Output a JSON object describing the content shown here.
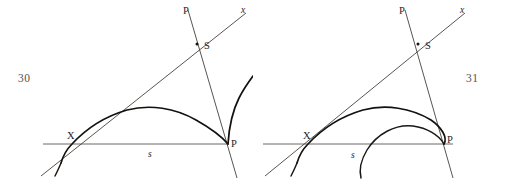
{
  "document": {
    "kind": "geometry-figure-pair",
    "background_color": "#ffffff",
    "ink_color": "#13100e",
    "thin_line_color": "#3a3632",
    "baseline_color": "#6b6864"
  },
  "figures": [
    {
      "id": "figure-30",
      "page_number": "30",
      "page_number_side": "left",
      "caption": "",
      "labels": {
        "apex_line": "P",
        "ray": "x",
        "intersection": "S",
        "left_point": "X",
        "right_point": "P",
        "baseline": "s"
      },
      "description": "Cycloid-type curve with a cusp at P and an ascending branch",
      "geometry": {
        "baseline_y": 144,
        "point_X": [
          64,
          144
        ],
        "point_P": [
          228,
          144
        ],
        "point_S": [
          197,
          44
        ],
        "ray_x_end": [
          245,
          14
        ],
        "line_P_top": [
          188,
          10
        ],
        "line_P_bottom": [
          236,
          178
        ]
      }
    },
    {
      "id": "figure-31",
      "page_number": "31",
      "page_number_side": "right",
      "caption": "",
      "labels": {
        "apex_line": "P",
        "ray": "x",
        "intersection": "S",
        "left_point": "X",
        "right_point": "P",
        "baseline": "s"
      },
      "description": "Two arcs meeting at P: an outer arch from X and an inner smaller arch",
      "geometry": {
        "baseline_y": 144,
        "point_X": [
          47,
          144
        ],
        "point_P": [
          191,
          144
        ],
        "point_S": [
          165,
          44
        ],
        "ray_x_end": [
          211,
          14
        ],
        "line_P_top": [
          152,
          10
        ],
        "line_P_bottom": [
          199,
          178
        ]
      }
    }
  ],
  "page_numbers": {
    "left": "30",
    "right": "31"
  }
}
